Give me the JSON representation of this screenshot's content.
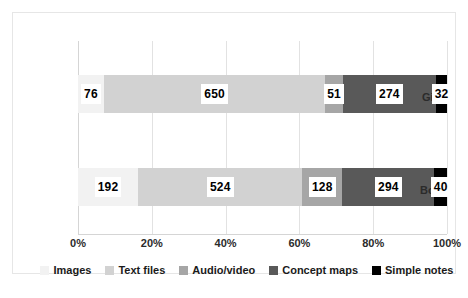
{
  "chart_data": {
    "type": "bar",
    "subtype": "stacked-horizontal-100pct",
    "title": "",
    "xlabel": "",
    "ylabel": "",
    "categories": [
      "Girls",
      "Boys"
    ],
    "series": [
      {
        "name": "Images",
        "color": "#f2f2f2",
        "values": [
          76,
          192
        ]
      },
      {
        "name": "Text files",
        "color": "#d2d2d2",
        "values": [
          650,
          524
        ]
      },
      {
        "name": "Audio/video",
        "color": "#a6a6a6",
        "values": [
          51,
          128
        ]
      },
      {
        "name": "Concept maps",
        "color": "#595959",
        "values": [
          274,
          294
        ]
      },
      {
        "name": "Simple notes",
        "color": "#000000",
        "values": [
          32,
          40
        ]
      }
    ],
    "totals": [
      1083,
      1178
    ],
    "xticks": [
      "0%",
      "20%",
      "40%",
      "60%",
      "80%",
      "100%"
    ],
    "xtick_values": [
      0,
      20,
      40,
      60,
      80,
      100
    ],
    "xlim": [
      0,
      100
    ],
    "grid": true,
    "legend_position": "bottom"
  },
  "legend": {
    "items": [
      {
        "label": "Images",
        "swatch_name": "legend-swatch-images"
      },
      {
        "label": "Text files",
        "swatch_name": "legend-swatch-text-files"
      },
      {
        "label": "Audio/video",
        "swatch_name": "legend-swatch-audio-video"
      },
      {
        "label": "Concept maps",
        "swatch_name": "legend-swatch-concept-maps"
      },
      {
        "label": "Simple notes",
        "swatch_name": "legend-swatch-simple-notes"
      }
    ]
  },
  "bars": {
    "girls": {
      "category": "Girls",
      "segments": [
        {
          "series": "Images",
          "value": "76"
        },
        {
          "series": "Text files",
          "value": "650"
        },
        {
          "series": "Audio/video",
          "value": "51"
        },
        {
          "series": "Concept maps",
          "value": "274"
        },
        {
          "series": "Simple notes",
          "value": "32"
        }
      ]
    },
    "boys": {
      "category": "Boys",
      "segments": [
        {
          "series": "Images",
          "value": "192"
        },
        {
          "series": "Text files",
          "value": "524"
        },
        {
          "series": "Audio/video",
          "value": "128"
        },
        {
          "series": "Concept maps",
          "value": "294"
        },
        {
          "series": "Simple notes",
          "value": "40"
        }
      ]
    }
  }
}
